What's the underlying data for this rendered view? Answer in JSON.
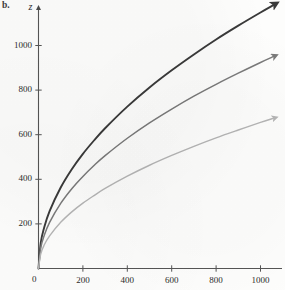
{
  "figure": {
    "panel_label": "b.",
    "background_color": "#fdfdfc"
  },
  "axes": {
    "y_axis_name": "z",
    "x_axis_name": "",
    "origin_label": "0",
    "x_ticks": [
      {
        "value": 200,
        "label": "200"
      },
      {
        "value": 400,
        "label": "400"
      },
      {
        "value": 600,
        "label": "600"
      },
      {
        "value": 800,
        "label": "800"
      },
      {
        "value": 1000,
        "label": "1000"
      }
    ],
    "y_ticks": [
      {
        "value": 200,
        "label": "200"
      },
      {
        "value": 400,
        "label": "400"
      },
      {
        "value": 600,
        "label": "600"
      },
      {
        "value": 800,
        "label": "800"
      },
      {
        "value": 1000,
        "label": "1000"
      }
    ],
    "axis_color": "#555555"
  },
  "chart_data": {
    "type": "line",
    "title": "",
    "xlabel": "",
    "ylabel": "z",
    "xlim": [
      0,
      1180
    ],
    "ylim": [
      0,
      1210
    ],
    "grid": false,
    "legend": "none",
    "annotations": [
      "Each curve terminates in an arrowhead indicating continued growth",
      "All three curves rise steeply from the origin then flatten (square-root shaped)"
    ],
    "x": [
      0,
      10,
      25,
      50,
      100,
      150,
      200,
      250,
      300,
      400,
      500,
      600,
      700,
      800,
      900,
      1000,
      1060
    ],
    "series": [
      {
        "name": "upper-curve",
        "color": "#3a3a3a",
        "stroke_width": 1.9,
        "values": [
          0,
          115,
          182,
          257,
          363,
          445,
          514,
          574,
          629,
          726,
          812,
          889,
          960,
          1027,
          1089,
          1148,
          1182
        ]
      },
      {
        "name": "middle-curve",
        "color": "#7a7a7a",
        "stroke_width": 1.5,
        "values": [
          0,
          92,
          146,
          207,
          292,
          358,
          413,
          462,
          506,
          584,
          653,
          715,
          773,
          826,
          876,
          924,
          951
        ]
      },
      {
        "name": "lower-curve",
        "color": "#b5b5b5",
        "stroke_width": 1.4,
        "values": [
          0,
          65,
          104,
          146,
          207,
          254,
          293,
          327,
          359,
          414,
          463,
          507,
          548,
          586,
          621,
          655,
          674
        ]
      }
    ]
  }
}
